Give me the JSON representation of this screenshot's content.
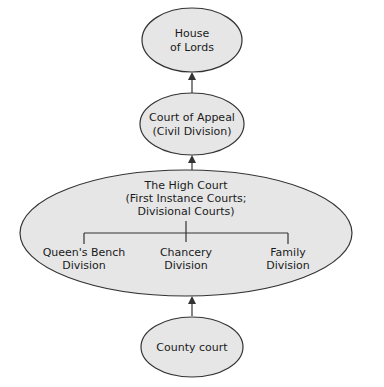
{
  "diagram": {
    "type": "court-hierarchy",
    "colors": {
      "node_fill": "#e6e6e6",
      "stroke": "#333333",
      "text": "#1a1a1a"
    },
    "nodes": {
      "house_of_lords": {
        "line1": "House",
        "line2": "of Lords"
      },
      "court_of_appeal": {
        "line1": "Court of Appeal",
        "line2": "(Civil Division)"
      },
      "high_court": {
        "line1": "The High Court",
        "line2": "(First Instance Courts;",
        "line3": "Divisional Courts)",
        "divisions": [
          {
            "line1": "Queen's Bench",
            "line2": "Division"
          },
          {
            "line1": "Chancery",
            "line2": "Division"
          },
          {
            "line1": "Family",
            "line2": "Division"
          }
        ]
      },
      "county_court": {
        "line1": "County court"
      }
    },
    "edges": [
      {
        "from": "county_court",
        "to": "high_court"
      },
      {
        "from": "high_court",
        "to": "court_of_appeal"
      },
      {
        "from": "court_of_appeal",
        "to": "house_of_lords"
      }
    ]
  }
}
